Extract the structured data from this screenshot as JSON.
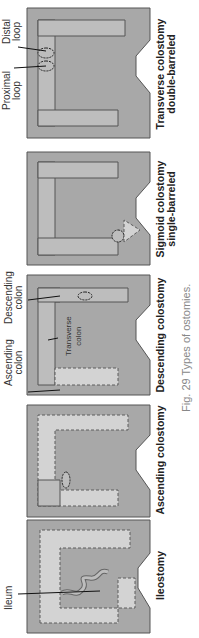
{
  "figure": {
    "caption_prefix": "Fig. 29",
    "caption_text": "Types of ostomies."
  },
  "colors": {
    "body": "#a8a8a8",
    "colon_band": "#d3d3d3",
    "colon_active": "#bdbdbd",
    "dashed": "#5c5c5c",
    "outline": "#555555",
    "label": "#222222",
    "caption": "#888888"
  },
  "panels": [
    {
      "id": "ileostomy",
      "label_line1": "Ileostomy",
      "label_line2": "",
      "callouts": [
        "Ileum"
      ]
    },
    {
      "id": "ascending",
      "label_line1": "Ascending colostomy",
      "label_line2": "",
      "callouts": []
    },
    {
      "id": "descending",
      "label_line1": "Descending colostomy",
      "label_line2": "",
      "callouts": [
        "Ascending",
        "colon",
        "Descending",
        "colon",
        "Transverse",
        "colon"
      ]
    },
    {
      "id": "sigmoid",
      "label_line1": "Sigmoid colostomy",
      "label_line2": "single-barreled",
      "callouts": []
    },
    {
      "id": "transverse",
      "label_line1": "Transverse colostomy",
      "label_line2": "double-barreled",
      "callouts": [
        "Proximal",
        "loop",
        "Distal",
        "loop"
      ]
    }
  ]
}
